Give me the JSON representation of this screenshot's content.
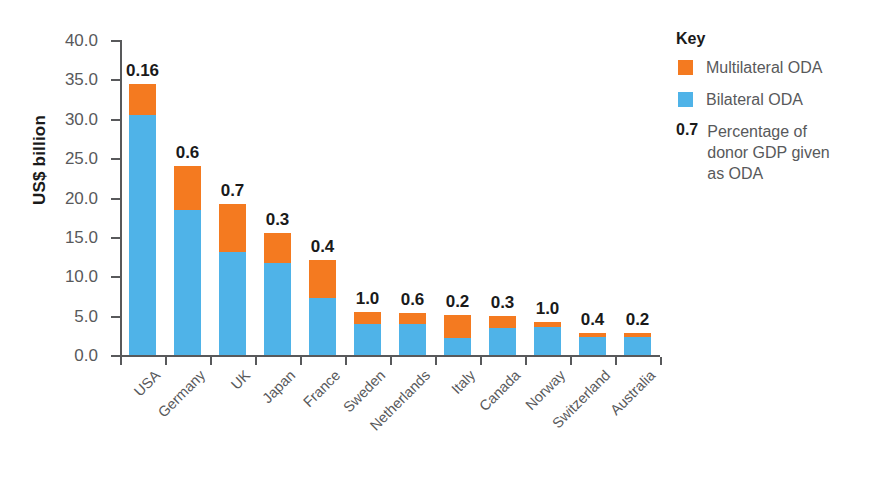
{
  "chart_data": {
    "type": "bar",
    "title": "",
    "xlabel": "",
    "ylabel": "US$ billion",
    "ylim": [
      0,
      40
    ],
    "ytick_step": 5,
    "grid": false,
    "stacked": true,
    "yticks": [
      "40.0",
      "35.0",
      "30.0",
      "25.0",
      "20.0",
      "15.0",
      "10.0",
      "5.0",
      "0.0"
    ],
    "ytick_values": [
      40,
      35,
      30,
      25,
      20,
      15,
      10,
      5,
      0
    ],
    "categories": [
      "USA",
      "Germany",
      "UK",
      "Japan",
      "France",
      "Sweden",
      "Netherlands",
      "Italy",
      "Canada",
      "Norway",
      "Switzerland",
      "Australia"
    ],
    "series": [
      {
        "name": "Bilateral ODA",
        "color": "#4FB3E8",
        "values": [
          30.5,
          18.4,
          13.1,
          11.7,
          7.2,
          3.9,
          3.9,
          2.2,
          3.4,
          3.6,
          2.3,
          2.3
        ]
      },
      {
        "name": "Multilateral ODA",
        "color": "#F47A20",
        "values": [
          3.9,
          5.6,
          6.1,
          3.8,
          4.9,
          1.6,
          1.4,
          2.9,
          1.6,
          0.6,
          0.5,
          0.5
        ]
      }
    ],
    "totals": [
      34.4,
      24.0,
      19.2,
      15.5,
      12.1,
      5.5,
      5.3,
      5.1,
      5.0,
      4.2,
      2.8,
      2.8
    ],
    "data_labels": [
      "0.16",
      "0.6",
      "0.7",
      "0.3",
      "0.4",
      "1.0",
      "0.6",
      "0.2",
      "0.3",
      "1.0",
      "0.4",
      "0.2"
    ],
    "data_label_meaning": "Percentage of donor GDP given as ODA",
    "legend_position": "right"
  },
  "legend": {
    "title": "Key",
    "entries": [
      {
        "type": "swatch",
        "swatch_name": "multilateral-oda-swatch",
        "color": "#F47A20",
        "label": "Multilateral ODA"
      },
      {
        "type": "swatch",
        "swatch_name": "bilateral-oda-swatch",
        "color": "#4FB3E8",
        "label": "Bilateral ODA"
      },
      {
        "type": "value",
        "number": "0.7",
        "label": "Percentage of donor GDP given as ODA"
      }
    ]
  }
}
